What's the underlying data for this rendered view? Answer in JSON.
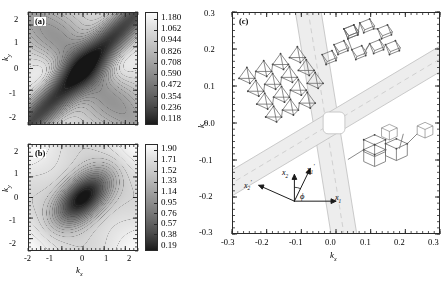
{
  "figure": {
    "panels": [
      {
        "tag": "(a)",
        "type": "contour",
        "xlabel": "k",
        "xlabel_sub": "x",
        "ylabel": "k",
        "ylabel_sub": "y",
        "xticks": [
          "-2",
          "-1",
          "0",
          "1",
          "2"
        ],
        "yticks": [
          "2",
          "1",
          "0",
          "-1",
          "-2"
        ],
        "xlim": [
          -2.6,
          2.6
        ],
        "ylim": [
          -2.6,
          2.6
        ],
        "colorbar_levels": [
          "1.180",
          "1.062",
          "0.944",
          "0.826",
          "0.708",
          "0.590",
          "0.472",
          "0.354",
          "0.236",
          "0.118"
        ]
      },
      {
        "tag": "(b)",
        "type": "contour",
        "xlabel": "k",
        "xlabel_sub": "x",
        "ylabel": "k",
        "ylabel_sub": "y",
        "xticks": [
          "-2",
          "-1",
          "0",
          "1",
          "2"
        ],
        "yticks": [
          "2",
          "1",
          "0",
          "-1",
          "-2"
        ],
        "xlim": [
          -2.6,
          2.6
        ],
        "ylim": [
          -2.6,
          2.6
        ],
        "colorbar_levels": [
          "1.90",
          "1.71",
          "1.52",
          "1.33",
          "1.14",
          "0.95",
          "0.76",
          "0.57",
          "0.38",
          "0.19"
        ]
      },
      {
        "tag": "(c)",
        "type": "band-diagram",
        "xlabel": "k",
        "xlabel_sub": "x",
        "ylabel": "k",
        "ylabel_sub": "y",
        "xticks": [
          "-0.3",
          "-0.2",
          "-0.1",
          "0.0",
          "0.1",
          "0.2",
          "0.3"
        ],
        "yticks": [
          "0.3",
          "0.2",
          "0.1",
          "0.0",
          "-0.1",
          "-0.2",
          "-0.3"
        ],
        "xlim": [
          -0.3,
          0.3
        ],
        "ylim": [
          -0.3,
          0.3
        ],
        "axes_annotation": {
          "x1": "x",
          "x1_sub": "1",
          "x2": "x",
          "x2_sub": "2",
          "x1p": "x",
          "x1p_sub": "1",
          "x1p_prime": "'",
          "x2p": "x",
          "x2p_sub": "2",
          "x2p_prime": "'",
          "angle": "ϕ"
        },
        "insets": [
          {
            "name": "crystal-inset-left"
          },
          {
            "name": "crystal-inset-top"
          },
          {
            "name": "crystal-inset-right"
          }
        ]
      }
    ],
    "colors": {
      "axis": "#2a2a2a",
      "contour_line": "#555555",
      "band_fill": "#e9e9e9",
      "band_edge": "#bdbdbd",
      "band_dash": "#c9c9c9",
      "structure_line": "#6a6a6a",
      "structure_node": "#444444"
    }
  }
}
